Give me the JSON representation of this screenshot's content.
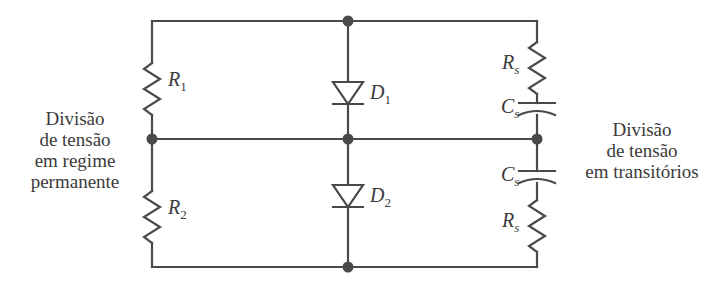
{
  "figure": {
    "background_color": "#ffffff",
    "line_color": "#4a4a4a",
    "text_color": "#3b3b3b",
    "width": 716,
    "height": 288
  },
  "captions": {
    "left": "Divisão\nde tensão\nem regime\npermanente",
    "left_lines": [
      "Divisão",
      "de tensão",
      "em regime",
      "permanente"
    ],
    "right": "Divisão\nde tensão\nem transitórios",
    "right_lines": [
      "Divisão",
      "de tensão",
      "em transitórios"
    ]
  },
  "components": {
    "r1": {
      "label": "R",
      "sub": "1",
      "type": "resistor",
      "branch": "left-top"
    },
    "r2": {
      "label": "R",
      "sub": "2",
      "type": "resistor",
      "branch": "left-bottom"
    },
    "d1": {
      "label": "D",
      "sub": "1",
      "type": "diode",
      "branch": "center-top",
      "orientation": "down"
    },
    "d2": {
      "label": "D",
      "sub": "2",
      "type": "diode",
      "branch": "center-bottom",
      "orientation": "down"
    },
    "rs_top": {
      "label": "R",
      "sub": "s",
      "type": "resistor",
      "branch": "right-top"
    },
    "cs_top": {
      "label": "C",
      "sub": "s",
      "type": "capacitor",
      "branch": "right-top"
    },
    "cs_bottom": {
      "label": "C",
      "sub": "s",
      "type": "capacitor",
      "branch": "right-bottom"
    },
    "rs_bottom": {
      "label": "R",
      "sub": "s",
      "type": "resistor",
      "branch": "right-bottom"
    }
  },
  "nodes": {
    "top_center": "junction-dot",
    "mid_left": "junction-dot",
    "mid_center": "junction-dot",
    "mid_right": "junction-dot",
    "bottom_center": "junction-dot"
  }
}
